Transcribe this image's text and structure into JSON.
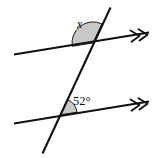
{
  "figure": {
    "type": "geometry-diagram",
    "background_color": "#ffffff",
    "line_color": "#111111",
    "sector_fill_color": "#c8c8c8",
    "sector_stroke_color": "#1a1a1a",
    "width": 152,
    "height": 158
  },
  "labels": {
    "unknown_angle": "x",
    "known_angle": "52°"
  },
  "lines": [
    {
      "name": "upper-parallel-line",
      "x1": 14,
      "y1": 54.5,
      "x2": 149,
      "y2": 32.5,
      "arrow_marker": "double-arrow-right",
      "arrow_count": 2
    },
    {
      "name": "lower-parallel-line",
      "x1": 14,
      "y1": 123.5,
      "x2": 149,
      "y2": 101.5,
      "arrow_marker": "double-arrow-right",
      "arrow_count": 2
    },
    {
      "name": "transversal-line",
      "x1": 110.5,
      "y1": 7.5,
      "x2": 42.5,
      "y2": 153.5,
      "arrow_marker": "none",
      "arrow_count": 0
    }
  ],
  "intersections": [
    {
      "name": "upper-intersection",
      "x": 93.0,
      "y": 42.9
    },
    {
      "name": "lower-intersection",
      "x": 60.3,
      "y": 114.9
    }
  ],
  "angles": [
    {
      "name": "angle-x",
      "label": "x",
      "value_deg": 128,
      "vertex_x": 93.0,
      "vertex_y": 42.9,
      "radius": 21,
      "start_deg": 170.7,
      "end_deg": 295.0,
      "label_x": 79.5,
      "label_y": 27.5,
      "shaded": true
    },
    {
      "name": "angle-52",
      "label": "52°",
      "value_deg": 52,
      "vertex_x": 60.3,
      "vertex_y": 114.9,
      "radius": 17,
      "start_deg": 350.7,
      "end_deg": 295.0,
      "label_x": 73.0,
      "label_y": 105.0,
      "shaded": true
    }
  ],
  "chart_data": {
    "type": "diagram",
    "annotations": [
      "x",
      "52°"
    ],
    "given": {
      "angle": "52°",
      "position": "lower intersection, right side above line"
    },
    "unknown": {
      "angle": "x",
      "position": "upper intersection, left side above line"
    }
  }
}
